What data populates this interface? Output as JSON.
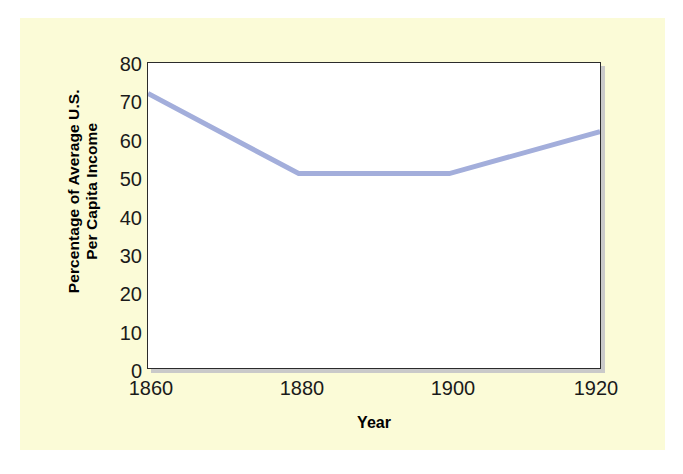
{
  "chart_data": {
    "type": "line",
    "title": "",
    "xlabel": "Year",
    "ylabel_lines": [
      "Percentage of Average U.S.",
      "Per Capita Income"
    ],
    "ylabel": "Percentage of Average U.S. Per Capita Income",
    "x": [
      1860,
      1880,
      1900,
      1920
    ],
    "categories": [
      "1860",
      "1880",
      "1900",
      "1920"
    ],
    "series": [
      {
        "name": "Percentage of Average U.S. Per Capita Income",
        "values": [
          72,
          51,
          51,
          62
        ]
      }
    ],
    "values": [
      72,
      51,
      51,
      62
    ],
    "xlim": [
      1860,
      1920
    ],
    "ylim": [
      0,
      80
    ],
    "yticks": [
      0,
      10,
      20,
      30,
      40,
      50,
      60,
      70,
      80
    ],
    "ytick_labels": [
      "0",
      "10",
      "20",
      "30",
      "40",
      "50",
      "60",
      "70",
      "80"
    ],
    "xticks": [
      1860,
      1880,
      1900,
      1920
    ],
    "xtick_labels": [
      "1860",
      "1880",
      "1900",
      "1920"
    ],
    "grid": false,
    "legend": false,
    "legend_position": "none",
    "line_color": "#a3aedb",
    "line_width": 5,
    "plot_background": "#ffffff",
    "figure_background": "#fbfbd7",
    "axis_color": "#2b2b2b",
    "text_color": "#1a1a1a"
  }
}
